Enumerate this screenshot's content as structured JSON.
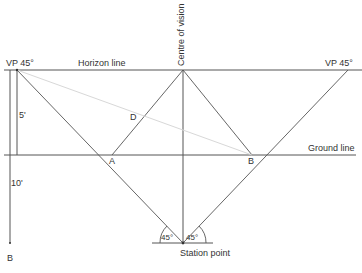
{
  "diagram": {
    "labels": {
      "vp_left": "VP 45°",
      "vp_right": "VP 45°",
      "horizon": "Horizon line",
      "centre": "Centre of vision",
      "ground": "Ground line",
      "station": "Station point",
      "point_a": "A",
      "point_b_ground": "B",
      "point_d": "D",
      "point_b_bottom": "B",
      "dim_5": "5'",
      "dim_10": "10'",
      "angle_left": "45°",
      "angle_right": "45°"
    },
    "colors": {
      "line": "#555555",
      "faint_line": "#d8d8d8",
      "text": "#333333"
    }
  }
}
